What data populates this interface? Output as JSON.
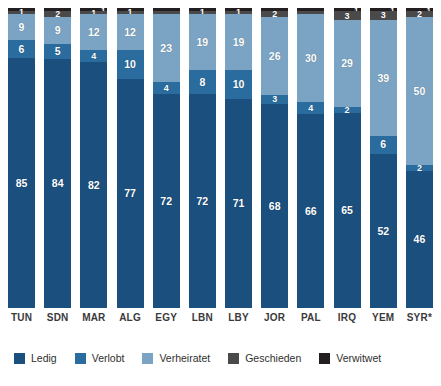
{
  "chart_data": {
    "type": "bar",
    "subtype": "stacked-bar-100",
    "title": "",
    "subtitle": "",
    "xlabel": "",
    "ylabel": "",
    "ylim": [
      0,
      100
    ],
    "grid": false,
    "legend_position": "bottom",
    "categories": [
      "TUN",
      "SDN",
      "MAR",
      "ALG",
      "EGY",
      "LBN",
      "LBY",
      "JOR",
      "PAL",
      "IRQ",
      "YEM",
      "SYR*"
    ],
    "series": [
      {
        "name": "Ledig",
        "color": "#1b4f7e",
        "values": [
          85,
          84,
          82,
          77,
          72,
          72,
          71,
          68,
          66,
          65,
          52,
          46
        ]
      },
      {
        "name": "Verlobt",
        "color": "#2a6c9e",
        "values": [
          6,
          5,
          4,
          10,
          4,
          8,
          10,
          3,
          4,
          2,
          6,
          2
        ]
      },
      {
        "name": "Verheiratet",
        "color": "#7ba4c4",
        "values": [
          9,
          9,
          12,
          12,
          23,
          19,
          19,
          26,
          30,
          29,
          39,
          50
        ]
      },
      {
        "name": "Geschieden",
        "color": "#4a4a4a",
        "values": [
          1,
          2,
          1,
          1,
          0,
          1,
          1,
          2,
          0,
          3,
          3,
          2
        ]
      },
      {
        "name": "Verwitwet",
        "color": "#231f20",
        "values": [
          0,
          0,
          1,
          0,
          0,
          0,
          0,
          0,
          0,
          1,
          1,
          1
        ]
      }
    ],
    "bars": [
      {
        "category": "TUN",
        "segments": [
          {
            "series": "Verwitwet",
            "value": 0,
            "label": "",
            "show_label": false,
            "superscript": false
          },
          {
            "series": "Geschieden",
            "value": 1,
            "label": "1",
            "show_label": true,
            "superscript": false
          },
          {
            "series": "Verheiratet",
            "value": 9,
            "label": "9",
            "show_label": true,
            "superscript": false
          },
          {
            "series": "Verlobt",
            "value": 6,
            "label": "6",
            "show_label": true,
            "superscript": false
          },
          {
            "series": "Ledig",
            "value": 85,
            "label": "85",
            "show_label": true,
            "superscript": false
          }
        ]
      },
      {
        "category": "SDN",
        "segments": [
          {
            "series": "Verwitwet",
            "value": 0,
            "label": "",
            "show_label": false,
            "superscript": false
          },
          {
            "series": "Geschieden",
            "value": 2,
            "label": "2",
            "show_label": true,
            "superscript": false
          },
          {
            "series": "Verheiratet",
            "value": 9,
            "label": "9",
            "show_label": true,
            "superscript": false
          },
          {
            "series": "Verlobt",
            "value": 5,
            "label": "5",
            "show_label": true,
            "superscript": false
          },
          {
            "series": "Ledig",
            "value": 84,
            "label": "84",
            "show_label": true,
            "superscript": false
          }
        ]
      },
      {
        "category": "MAR",
        "segments": [
          {
            "series": "Verwitwet",
            "value": 1,
            "label": "1",
            "show_label": true,
            "superscript": true
          },
          {
            "series": "Geschieden",
            "value": 1,
            "label": "1",
            "show_label": true,
            "superscript": false
          },
          {
            "series": "Verheiratet",
            "value": 12,
            "label": "12",
            "show_label": true,
            "superscript": false
          },
          {
            "series": "Verlobt",
            "value": 4,
            "label": "4",
            "show_label": true,
            "superscript": false
          },
          {
            "series": "Ledig",
            "value": 82,
            "label": "82",
            "show_label": true,
            "superscript": false
          }
        ]
      },
      {
        "category": "ALG",
        "segments": [
          {
            "series": "Verwitwet",
            "value": 0,
            "label": "",
            "show_label": false,
            "superscript": false
          },
          {
            "series": "Geschieden",
            "value": 1,
            "label": "1",
            "show_label": true,
            "superscript": false
          },
          {
            "series": "Verheiratet",
            "value": 12,
            "label": "12",
            "show_label": true,
            "superscript": false
          },
          {
            "series": "Verlobt",
            "value": 10,
            "label": "10",
            "show_label": true,
            "superscript": false
          },
          {
            "series": "Ledig",
            "value": 77,
            "label": "77",
            "show_label": true,
            "superscript": false
          }
        ]
      },
      {
        "category": "EGY",
        "segments": [
          {
            "series": "Verwitwet",
            "value": 0,
            "label": "",
            "show_label": false,
            "superscript": false
          },
          {
            "series": "Geschieden",
            "value": 0,
            "label": "",
            "show_label": false,
            "superscript": false
          },
          {
            "series": "Verheiratet",
            "value": 23,
            "label": "23",
            "show_label": true,
            "superscript": false
          },
          {
            "series": "Verlobt",
            "value": 4,
            "label": "4",
            "show_label": true,
            "superscript": false
          },
          {
            "series": "Ledig",
            "value": 72,
            "label": "72",
            "show_label": true,
            "superscript": false
          }
        ]
      },
      {
        "category": "LBN",
        "segments": [
          {
            "series": "Verwitwet",
            "value": 0,
            "label": "",
            "show_label": false,
            "superscript": false
          },
          {
            "series": "Geschieden",
            "value": 1,
            "label": "1",
            "show_label": true,
            "superscript": false
          },
          {
            "series": "Verheiratet",
            "value": 19,
            "label": "19",
            "show_label": true,
            "superscript": false
          },
          {
            "series": "Verlobt",
            "value": 8,
            "label": "8",
            "show_label": true,
            "superscript": false
          },
          {
            "series": "Ledig",
            "value": 72,
            "label": "72",
            "show_label": true,
            "superscript": false
          }
        ]
      },
      {
        "category": "LBY",
        "segments": [
          {
            "series": "Verwitwet",
            "value": 0,
            "label": "",
            "show_label": false,
            "superscript": false
          },
          {
            "series": "Geschieden",
            "value": 1,
            "label": "1",
            "show_label": true,
            "superscript": false
          },
          {
            "series": "Verheiratet",
            "value": 19,
            "label": "19",
            "show_label": true,
            "superscript": false
          },
          {
            "series": "Verlobt",
            "value": 10,
            "label": "10",
            "show_label": true,
            "superscript": false
          },
          {
            "series": "Ledig",
            "value": 71,
            "label": "71",
            "show_label": true,
            "superscript": false
          }
        ]
      },
      {
        "category": "JOR",
        "segments": [
          {
            "series": "Verwitwet",
            "value": 0,
            "label": "",
            "show_label": false,
            "superscript": false
          },
          {
            "series": "Geschieden",
            "value": 2,
            "label": "2",
            "show_label": true,
            "superscript": false
          },
          {
            "series": "Verheiratet",
            "value": 26,
            "label": "26",
            "show_label": true,
            "superscript": false
          },
          {
            "series": "Verlobt",
            "value": 3,
            "label": "3",
            "show_label": true,
            "superscript": false
          },
          {
            "series": "Ledig",
            "value": 68,
            "label": "68",
            "show_label": true,
            "superscript": false
          }
        ]
      },
      {
        "category": "PAL",
        "segments": [
          {
            "series": "Verwitwet",
            "value": 0,
            "label": "",
            "show_label": false,
            "superscript": false
          },
          {
            "series": "Geschieden",
            "value": 0,
            "label": "",
            "show_label": false,
            "superscript": false
          },
          {
            "series": "Verheiratet",
            "value": 30,
            "label": "30",
            "show_label": true,
            "superscript": false
          },
          {
            "series": "Verlobt",
            "value": 4,
            "label": "4",
            "show_label": true,
            "superscript": false
          },
          {
            "series": "Ledig",
            "value": 66,
            "label": "66",
            "show_label": true,
            "superscript": false
          }
        ]
      },
      {
        "category": "IRQ",
        "segments": [
          {
            "series": "Verwitwet",
            "value": 1,
            "label": "1",
            "show_label": true,
            "superscript": true
          },
          {
            "series": "Geschieden",
            "value": 3,
            "label": "3",
            "show_label": true,
            "superscript": false
          },
          {
            "series": "Verheiratet",
            "value": 29,
            "label": "29",
            "show_label": true,
            "superscript": false
          },
          {
            "series": "Verlobt",
            "value": 2,
            "label": "2",
            "show_label": true,
            "superscript": false
          },
          {
            "series": "Ledig",
            "value": 65,
            "label": "65",
            "show_label": true,
            "superscript": false
          }
        ]
      },
      {
        "category": "YEM",
        "segments": [
          {
            "series": "Verwitwet",
            "value": 1,
            "label": "1",
            "show_label": true,
            "superscript": true
          },
          {
            "series": "Geschieden",
            "value": 3,
            "label": "3",
            "show_label": true,
            "superscript": false
          },
          {
            "series": "Verheiratet",
            "value": 39,
            "label": "39",
            "show_label": true,
            "superscript": false
          },
          {
            "series": "Verlobt",
            "value": 6,
            "label": "6",
            "show_label": true,
            "superscript": false
          },
          {
            "series": "Ledig",
            "value": 52,
            "label": "52",
            "show_label": true,
            "superscript": false
          }
        ]
      },
      {
        "category": "SYR*",
        "segments": [
          {
            "series": "Verwitwet",
            "value": 1,
            "label": "1",
            "show_label": true,
            "superscript": true
          },
          {
            "series": "Geschieden",
            "value": 2,
            "label": "2",
            "show_label": true,
            "superscript": false
          },
          {
            "series": "Verheiratet",
            "value": 50,
            "label": "50",
            "show_label": true,
            "superscript": false
          },
          {
            "series": "Verlobt",
            "value": 2,
            "label": "2",
            "show_label": true,
            "superscript": false
          },
          {
            "series": "Ledig",
            "value": 46,
            "label": "46",
            "show_label": true,
            "superscript": false
          }
        ]
      }
    ],
    "legend": [
      {
        "label": "Ledig",
        "color": "#1b4f7e"
      },
      {
        "label": "Verlobt",
        "color": "#2a6c9e"
      },
      {
        "label": "Verheiratet",
        "color": "#7ba4c4"
      },
      {
        "label": "Geschieden",
        "color": "#4a4a4a"
      },
      {
        "label": "Verwitwet",
        "color": "#231f20"
      }
    ]
  }
}
